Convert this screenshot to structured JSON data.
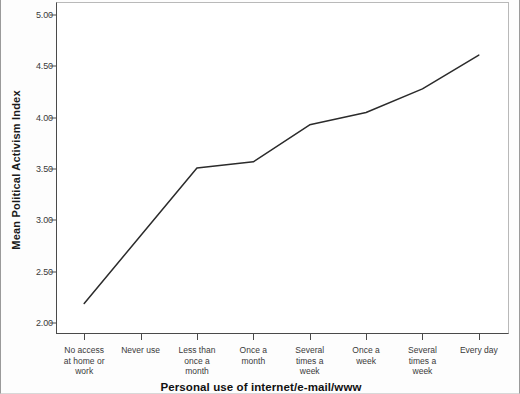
{
  "chart_data": {
    "type": "line",
    "title": "",
    "xlabel": "Personal use of internet/e-mail/www",
    "ylabel": "Mean Political Activism Index",
    "categories": [
      "No access at home or work",
      "Never use",
      "Less than once a month",
      "Once a month",
      "Several times a week",
      "Once a week",
      "Several times a week",
      "Every day"
    ],
    "category_lines": [
      [
        "No access",
        "at home or",
        "work"
      ],
      [
        "Never use"
      ],
      [
        "Less than",
        "once a",
        "month"
      ],
      [
        "Once a",
        "month"
      ],
      [
        "Several",
        "times a",
        "week"
      ],
      [
        "Once a",
        "week"
      ],
      [
        "Several",
        "times a",
        "week"
      ],
      [
        "Every day"
      ]
    ],
    "values": [
      2.19,
      2.85,
      3.51,
      3.57,
      3.93,
      4.05,
      4.28,
      4.61
    ],
    "ylim": [
      2.0,
      5.0
    ],
    "ytick_labels": [
      "5.00",
      "4.50",
      "4.00",
      "3.50",
      "3.00",
      "2.50",
      "2.00"
    ],
    "ytick_values": [
      5.0,
      4.5,
      4.0,
      3.5,
      3.0,
      2.5,
      2.0
    ],
    "grid": false,
    "legend": "none",
    "line_color": "#2b2b2b",
    "markers": false
  }
}
